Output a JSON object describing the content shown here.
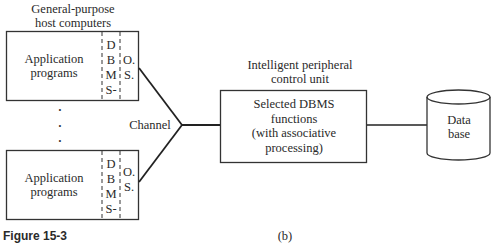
{
  "diagram": {
    "host_label": [
      "General-purpose",
      "host computers"
    ],
    "hosts": [
      {
        "app_label": [
          "Application",
          "programs"
        ],
        "dbms_letters": [
          "D",
          "B",
          "M",
          "S-"
        ],
        "os_letters": [
          "O.",
          "S."
        ]
      },
      {
        "app_label": [
          "Application",
          "programs"
        ],
        "dbms_letters": [
          "D",
          "B",
          "M",
          "S-"
        ],
        "os_letters": [
          "O.",
          "S."
        ]
      }
    ],
    "ellipsis": "•",
    "channel_label": "Channel",
    "control_unit_label": [
      "Intelligent peripheral",
      "control unit"
    ],
    "control_unit_box": [
      "Selected DBMS",
      "functions",
      "(with associative",
      "processing)"
    ],
    "database_label": [
      "Data",
      "base"
    ],
    "figure_caption": "Figure 15-3",
    "subfigure_label": "(b)"
  }
}
